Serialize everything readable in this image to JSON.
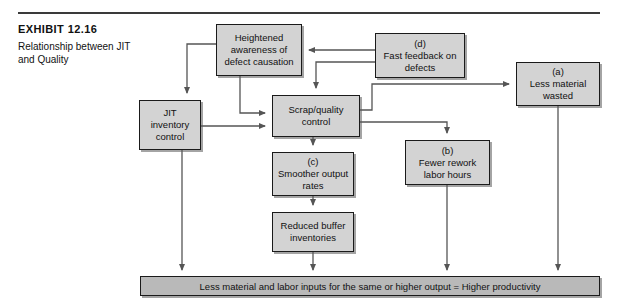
{
  "exhibit": {
    "title": "EXHIBIT 12.16",
    "subtitle": "Relationship between JIT and Quality"
  },
  "diagram": {
    "nodes": {
      "heightened": {
        "tag": "",
        "label": "Heightened awareness of defect causation"
      },
      "fast_feedback": {
        "tag": "(d)",
        "label": "Fast feedback on defects"
      },
      "less_material": {
        "tag": "(a)",
        "label": "Less material wasted"
      },
      "jit": {
        "tag": "",
        "label": "JIT inventory control"
      },
      "scrap": {
        "tag": "",
        "label": "Scrap/quality control"
      },
      "smoother": {
        "tag": "(c)",
        "label": "Smoother output rates"
      },
      "fewer_rework": {
        "tag": "(b)",
        "label": "Fewer rework labor hours"
      },
      "reduced_buffer": {
        "tag": "",
        "label": "Reduced buffer inventories"
      },
      "bottom_bar": {
        "tag": "",
        "label": "Less material and labor inputs for the same or higher output = Higher productivity"
      }
    },
    "colors": {
      "box_fill": "#d3d3d3",
      "bar_fill": "#b9b9b9",
      "stroke": "#1a1a1a",
      "connector": "#555555",
      "page": "#ffffff"
    }
  }
}
